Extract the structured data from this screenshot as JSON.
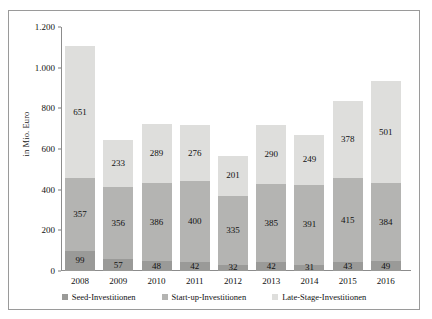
{
  "chart_data": {
    "type": "bar",
    "subtype": "stacked-bar",
    "title": "",
    "xlabel": "",
    "ylabel": "in Mio. Euro",
    "ylim": [
      0,
      1200
    ],
    "ytick_labels": [
      "1.200",
      "1.000",
      "800",
      "600",
      "400",
      "200",
      "0"
    ],
    "ytick_values": [
      1200,
      1000,
      800,
      600,
      400,
      200,
      0
    ],
    "grid": false,
    "legend_position": "bottom",
    "categories": [
      "2008",
      "2009",
      "2010",
      "2011",
      "2012",
      "2013",
      "2014",
      "2015",
      "2016"
    ],
    "series": [
      {
        "name": "Seed-Investitionen",
        "color": "#9a9a98",
        "values": [
          99,
          57,
          48,
          42,
          32,
          42,
          31,
          43,
          49
        ]
      },
      {
        "name": "Start-up-Investitionen",
        "color": "#b4b4b2",
        "values": [
          357,
          356,
          386,
          400,
          335,
          385,
          391,
          415,
          384
        ]
      },
      {
        "name": "Late-Stage-Investitionen",
        "color": "#dededc",
        "values": [
          651,
          233,
          289,
          276,
          201,
          290,
          249,
          378,
          501
        ]
      }
    ],
    "totals": [
      1107,
      646,
      723,
      718,
      568,
      717,
      671,
      836,
      934
    ]
  }
}
